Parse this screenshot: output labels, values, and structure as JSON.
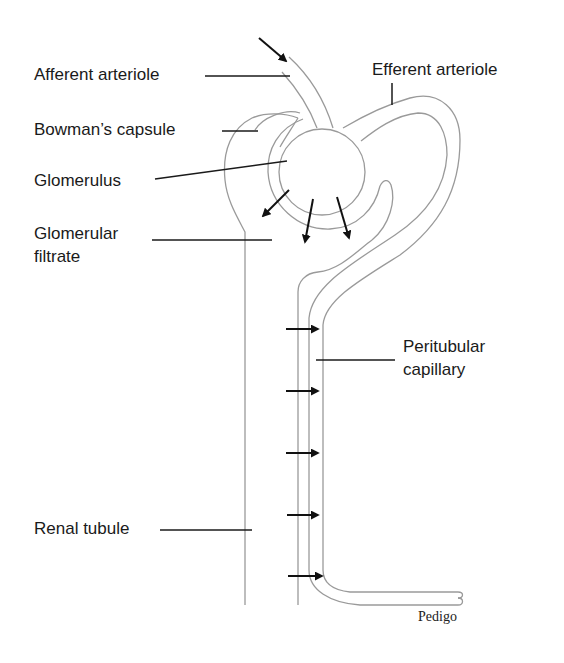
{
  "diagram": {
    "type": "anatomical-schematic",
    "labels": {
      "afferent_arteriole": "Afferent arteriole",
      "efferent_arteriole": "Efferent arteriole",
      "bowmans_capsule": "Bowman’s capsule",
      "glomerulus": "Glomerulus",
      "glomerular_filtrate_line1": "Glomerular",
      "glomerular_filtrate_line2": "filtrate",
      "peritubular_capillary_line1": "Peritubular",
      "peritubular_capillary_line2": "capillary",
      "renal_tubule": "Renal tubule"
    },
    "arrows": {
      "blood_inflow": 1,
      "filtration_into_capsule": 3,
      "reabsorption_tubule_to_capillary": 5
    },
    "credit": "Pedigo",
    "colors": {
      "outline": "#9a9a9a",
      "leader": "#1a1a1a",
      "arrow": "#111111",
      "background": "#ffffff"
    }
  }
}
